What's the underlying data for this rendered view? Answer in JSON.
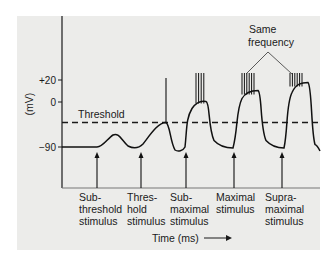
{
  "chart_data": {
    "type": "line",
    "title": "",
    "xlabel": "Time (ms)",
    "ylabel": "(mV)",
    "y_ticks": [
      {
        "value": 20,
        "label": "+20"
      },
      {
        "value": 0,
        "label": "0"
      },
      {
        "value": -90,
        "label": "-90"
      }
    ],
    "ylim": [
      -110,
      60
    ],
    "threshold": {
      "value": -45,
      "label": "Threshold"
    },
    "annotation": {
      "text_lines": [
        "Same",
        "frequency"
      ],
      "points_to": [
        "Maximal stimulus",
        "Supramaximal stimulus"
      ]
    },
    "stimuli": [
      {
        "label_lines": [
          "Sub-",
          "threshold",
          "stimulus"
        ],
        "action_potentials": 0,
        "response": "local depolarization below threshold"
      },
      {
        "label_lines": [
          "Thres-",
          "hold",
          "stimulus"
        ],
        "action_potentials": 1,
        "response": "single spike at threshold"
      },
      {
        "label_lines": [
          "Sub-",
          "maximal",
          "stimulus"
        ],
        "action_potentials": 4,
        "response": "plateau with burst"
      },
      {
        "label_lines": [
          "Maximal",
          "stimulus"
        ],
        "action_potentials": 6,
        "response": "higher plateau, max frequency"
      },
      {
        "label_lines": [
          "Supra-",
          "maximal",
          "stimulus"
        ],
        "action_potentials": 6,
        "response": "higher plateau, same frequency"
      }
    ],
    "resting_potential": -90,
    "time_arrow": true
  }
}
